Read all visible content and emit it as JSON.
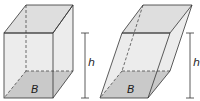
{
  "figures": [
    {
      "name": "right-prism",
      "base_label": "B",
      "height_label": "h"
    },
    {
      "name": "oblique-prism",
      "base_label": "B",
      "height_label": "h"
    }
  ],
  "colors": {
    "edge": "#333333",
    "face": "#e8e8e8",
    "top": "#dcdcdc",
    "base": "#c8c8c8",
    "background": "#ffffff"
  }
}
